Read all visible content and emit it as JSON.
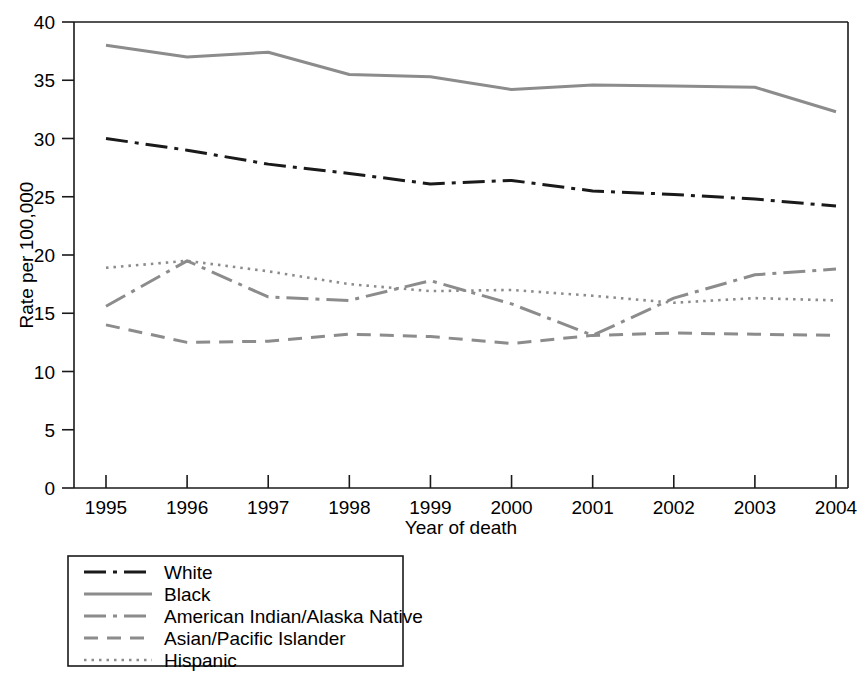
{
  "chart_data": {
    "type": "line",
    "title": "",
    "xlabel": "Year of death",
    "ylabel": "Rate per 100,000",
    "x": [
      1995,
      1996,
      1997,
      1998,
      1999,
      2000,
      2001,
      2002,
      2003,
      2004
    ],
    "xticklabels": [
      "1995",
      "1996",
      "1997",
      "1998",
      "1999",
      "2000",
      "2001",
      "2002",
      "2003",
      "2004"
    ],
    "yticklabels": [
      "0",
      "5",
      "10",
      "15",
      "20",
      "25",
      "30",
      "35",
      "40"
    ],
    "yticks": [
      0,
      5,
      10,
      15,
      20,
      25,
      30,
      35,
      40
    ],
    "ylim": [
      0,
      40
    ],
    "xlim": [
      1995,
      2004
    ],
    "grid": false,
    "legend_position": "below-left",
    "series": [
      {
        "name": "White",
        "values": [
          30.0,
          29.0,
          27.8,
          27.0,
          26.1,
          26.4,
          25.5,
          25.2,
          24.8,
          24.2
        ],
        "color": "#1a1a1a",
        "dash": "dashdot",
        "width": 3.0
      },
      {
        "name": "Black",
        "values": [
          38.0,
          37.0,
          37.4,
          35.5,
          35.3,
          34.2,
          34.6,
          34.5,
          34.4,
          32.3
        ],
        "color": "#8c8c8c",
        "dash": "solid",
        "width": 3.0
      },
      {
        "name": "American Indian/Alaska Native",
        "values": [
          15.6,
          19.5,
          16.4,
          16.1,
          17.8,
          15.8,
          13.1,
          16.3,
          18.3,
          18.8
        ],
        "color": "#8c8c8c",
        "dash": "dashdot",
        "width": 3.0
      },
      {
        "name": "Asian/Pacific Islander",
        "values": [
          14.0,
          12.5,
          12.6,
          13.2,
          13.0,
          12.4,
          13.1,
          13.3,
          13.2,
          13.1
        ],
        "color": "#8c8c8c",
        "dash": "dashed",
        "width": 3.0
      },
      {
        "name": "Hispanic",
        "values": [
          18.9,
          19.5,
          18.6,
          17.5,
          16.9,
          17.0,
          16.5,
          15.9,
          16.3,
          16.1
        ],
        "color": "#8c8c8c",
        "dash": "dotted",
        "width": 2.6
      }
    ]
  },
  "legend": {
    "entries": [
      {
        "label": "White"
      },
      {
        "label": "Black"
      },
      {
        "label": "American Indian/Alaska Native"
      },
      {
        "label": "Asian/Pacific Islander"
      },
      {
        "label": "Hispanic"
      }
    ]
  }
}
